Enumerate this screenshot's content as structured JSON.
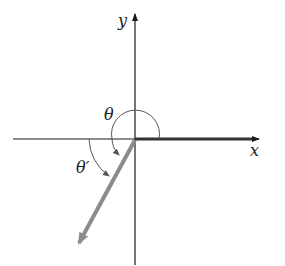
{
  "diagram": {
    "title": "",
    "type": "reference-angle",
    "axes": {
      "x_label": "x",
      "y_label": "y"
    },
    "angles": {
      "theta_label": "θ",
      "theta_prime_label": "θ′"
    },
    "colors": {
      "axis": "#1a1a1a",
      "initial_side": "#333333",
      "terminal_side": "#8c8c8c",
      "arc": "#555555"
    }
  }
}
